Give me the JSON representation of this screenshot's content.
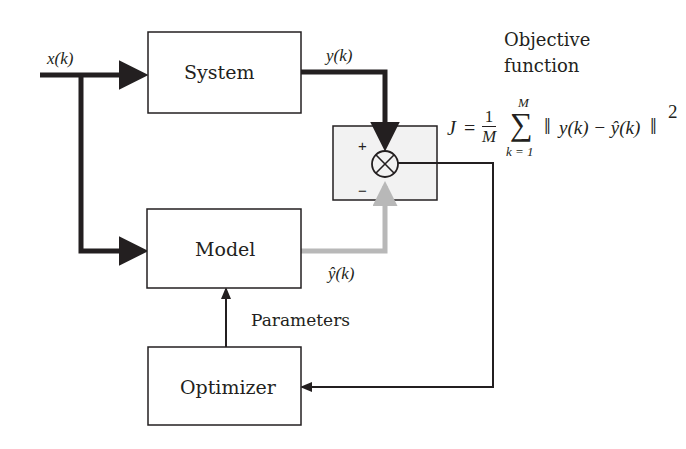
{
  "diagram": {
    "type": "block-diagram",
    "blocks": {
      "system": {
        "label": "System"
      },
      "model": {
        "label": "Model"
      },
      "optimizer": {
        "label": "Optimizer"
      },
      "comparator": {
        "symbol": "⊗",
        "plus_sign": "+",
        "minus_sign": "−"
      }
    },
    "signals": {
      "input": "x(k)",
      "system_output": "y(k)",
      "model_output": "ŷ(k)",
      "parameters": "Parameters"
    },
    "objective": {
      "title_line1": "Objective",
      "title_line2": "function",
      "lhs": "J",
      "equals": "=",
      "frac_num": "1",
      "frac_den": "M",
      "sum_symbol": "∑",
      "sum_upper": "M",
      "sum_lower": "k = 1",
      "norm_open": "‖",
      "term": "y(k) − ŷ(k)",
      "norm_close": "‖",
      "exponent": "2"
    },
    "colors": {
      "line": "#231f20",
      "model_path": "#b8b8b8",
      "comparator_fill": "#f2f2f2"
    }
  }
}
